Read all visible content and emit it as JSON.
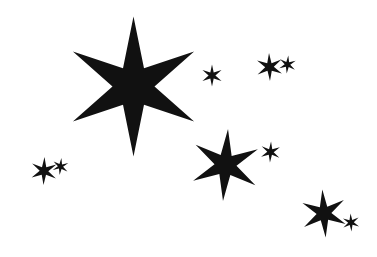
{
  "artwork": {
    "title": "Six-pointed star cluster",
    "description": "Black six-pointed stars of varying sizes scattered on a plain white field",
    "width": 377,
    "height": 257,
    "background_color": "#ffffff",
    "ink_color": "#111111",
    "star_count": 9,
    "point_count": 6
  },
  "stars": [
    {
      "name": "star-primary-large",
      "label": "Large star",
      "cx": 133.5,
      "cy": 86.5,
      "outer_radius": 70,
      "inner_radius": 21,
      "rotation": 0,
      "color": "#111111"
    },
    {
      "name": "star-secondary-medium",
      "label": "Medium star",
      "cx": 225.5,
      "cy": 165.0,
      "outer_radius": 36,
      "inner_radius": 11,
      "rotation": 4,
      "color": "#111111"
    },
    {
      "name": "star-lower-right-medium",
      "label": "Lower right star",
      "cx": 324.0,
      "cy": 213.5,
      "outer_radius": 24,
      "inner_radius": 7.4,
      "rotation": -4,
      "color": "#111111"
    },
    {
      "name": "star-left-cluster-medium",
      "label": "Left cluster star",
      "cx": 44.0,
      "cy": 171.0,
      "outer_radius": 14,
      "inner_radius": 4.3,
      "rotation": 2,
      "color": "#111111"
    },
    {
      "name": "star-left-cluster-small",
      "label": "Left cluster small star",
      "cx": 60.5,
      "cy": 166.5,
      "outer_radius": 8.5,
      "inner_radius": 2.6,
      "rotation": 6,
      "color": "#111111"
    },
    {
      "name": "star-top-right-cluster-medium",
      "label": "Top right cluster star",
      "cx": 269.5,
      "cy": 67.0,
      "outer_radius": 14,
      "inner_radius": 4.3,
      "rotation": -2,
      "color": "#111111"
    },
    {
      "name": "star-top-right-cluster-small",
      "label": "Top right cluster small star",
      "cx": 287.5,
      "cy": 64.5,
      "outer_radius": 9,
      "inner_radius": 2.8,
      "rotation": 5,
      "color": "#111111"
    },
    {
      "name": "star-upper-middle-small",
      "label": "Upper middle small star",
      "cx": 212.0,
      "cy": 75.5,
      "outer_radius": 11,
      "inner_radius": 3.4,
      "rotation": 0,
      "color": "#111111"
    },
    {
      "name": "star-mid-right-small",
      "label": "Mid right small star",
      "cx": 270.5,
      "cy": 152.0,
      "outer_radius": 10.5,
      "inner_radius": 3.2,
      "rotation": 3,
      "color": "#111111"
    },
    {
      "name": "star-bottom-right-small",
      "label": "Bottom right small star",
      "cx": 351.0,
      "cy": 222.5,
      "outer_radius": 9,
      "inner_radius": 2.8,
      "rotation": -3,
      "color": "#111111"
    }
  ]
}
